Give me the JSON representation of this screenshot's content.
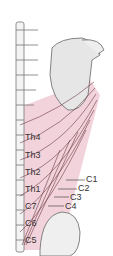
{
  "diagram": {
    "colors": {
      "muscle_fill": "#f3d3db",
      "muscle_line": "#6b3a46",
      "bone_fill": "#e8e8e8",
      "bone_line": "#666666",
      "label": "#333333"
    },
    "left_labels": [
      {
        "text": "Th4",
        "x": 25,
        "y": 137
      },
      {
        "text": "Th3",
        "x": 25,
        "y": 155
      },
      {
        "text": "Th2",
        "x": 25,
        "y": 172
      },
      {
        "text": "Th1",
        "x": 25,
        "y": 189
      },
      {
        "text": "C7",
        "x": 25,
        "y": 206
      },
      {
        "text": "C6",
        "x": 25,
        "y": 223
      },
      {
        "text": "C5",
        "x": 25,
        "y": 240
      }
    ],
    "right_labels": [
      {
        "text": "C1",
        "x": 86,
        "y": 177
      },
      {
        "text": "C2",
        "x": 78,
        "y": 185
      },
      {
        "text": "C3",
        "x": 70,
        "y": 194
      },
      {
        "text": "C4",
        "x": 65,
        "y": 203
      }
    ]
  }
}
